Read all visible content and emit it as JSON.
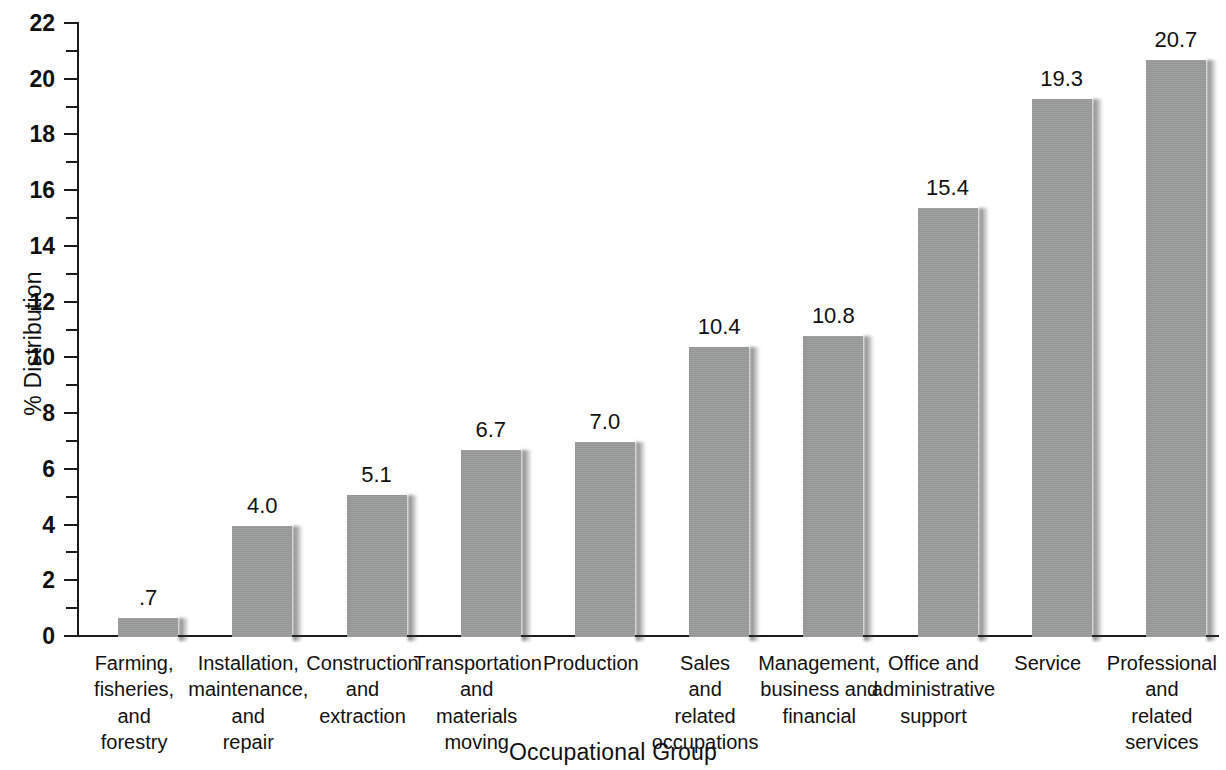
{
  "chart_data": {
    "type": "bar",
    "title": "",
    "xlabel": "Occupational Group",
    "ylabel": "% Distribution",
    "ylim": [
      0,
      22
    ],
    "ytick_step": 2,
    "minor_tick_step": 1,
    "grid": false,
    "legend": false,
    "bar_color": "#9b9c9c",
    "axis_color": "#1b1b1b",
    "categories": [
      "Farming,\nfisheries,\nand\nforestry",
      "Installation,\nmaintenance,\nand\nrepair",
      "Construction\nand\nextraction",
      "Transportation\nand\nmaterials\nmoving",
      "Production",
      "Sales\nand\nrelated\noccupations",
      "Management,\nbusiness and\nfinancial",
      "Office and\nadministrative\nsupport",
      "Service",
      "Professional\nand\nrelated\nservices"
    ],
    "values": [
      0.7,
      4.0,
      5.1,
      6.7,
      7.0,
      10.4,
      10.8,
      15.4,
      19.3,
      20.7
    ],
    "value_labels": [
      ".7",
      "4.0",
      "5.1",
      "6.7",
      "7.0",
      "10.4",
      "10.8",
      "15.4",
      "19.3",
      "20.7"
    ],
    "ytick_labels": [
      "0",
      "2",
      "4",
      "6",
      "8",
      "10",
      "12",
      "14",
      "16",
      "18",
      "20",
      "22"
    ]
  },
  "axes": {
    "y_title": "% Distribution",
    "x_title": "Occupational Group"
  }
}
